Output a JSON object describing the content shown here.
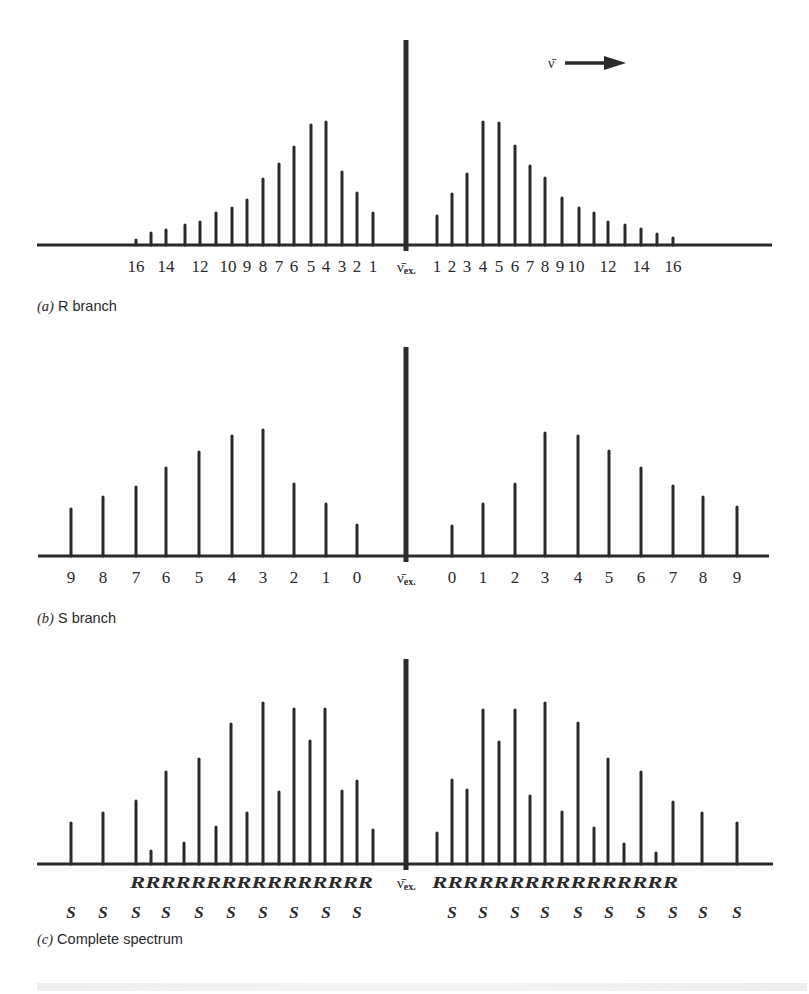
{
  "figure": {
    "direction_label": "ν̄",
    "center_label_main": "ν̄",
    "center_label_sub": "ex.",
    "ink_color": "#2a2a2a",
    "background": "#ffffff"
  },
  "panels": [
    {
      "id": "a",
      "caption_letter": "(a)",
      "caption_text": " R branch"
    },
    {
      "id": "b",
      "caption_letter": "(b)",
      "caption_text": " S branch"
    },
    {
      "id": "c",
      "caption_letter": "(c)",
      "caption_text": " Complete spectrum"
    }
  ],
  "chart_data": [
    {
      "type": "bar",
      "title": "(a) R branch",
      "xlabel": "",
      "ylabel": "",
      "center_label": "ν̄ex.",
      "layout": {
        "baseline_y": 245,
        "axis_x": [
          37,
          772
        ],
        "center_x": 406,
        "center_top": 40,
        "tick_label_y": 272
      },
      "left": {
        "labels_shown": [
          "16",
          "14",
          "12",
          "10",
          "9",
          "8",
          "7",
          "6",
          "5",
          "4",
          "3",
          "2",
          "1"
        ],
        "J": [
          16,
          15,
          14,
          13,
          12,
          11,
          10,
          9,
          8,
          7,
          6,
          5,
          4,
          3,
          2,
          1
        ],
        "x": [
          136,
          151,
          166,
          185,
          200,
          216,
          232,
          247,
          263,
          279,
          294,
          311,
          326,
          342,
          357,
          373
        ],
        "height": [
          5,
          12,
          15,
          20,
          23,
          32,
          37,
          45,
          66,
          81,
          98,
          120,
          123,
          73,
          52,
          32
        ]
      },
      "right": {
        "labels_shown": [
          "1",
          "2",
          "3",
          "4",
          "5",
          "6",
          "7",
          "8",
          "9",
          "10",
          "12",
          "14",
          "16"
        ],
        "J": [
          1,
          2,
          3,
          4,
          5,
          6,
          7,
          8,
          9,
          10,
          11,
          12,
          13,
          14,
          15,
          16
        ],
        "x": [
          437,
          452,
          467,
          483,
          499,
          515,
          530,
          545,
          562,
          579,
          594,
          608,
          625,
          641,
          657,
          673
        ],
        "height": [
          29,
          51,
          71,
          123,
          122,
          99,
          79,
          67,
          47,
          37,
          32,
          23,
          20,
          16,
          11,
          7
        ]
      },
      "tick_labels_left": [
        {
          "t": "16",
          "x": 136
        },
        {
          "t": "14",
          "x": 166
        },
        {
          "t": "12",
          "x": 200
        },
        {
          "t": "10",
          "x": 228
        },
        {
          "t": "9",
          "x": 247
        },
        {
          "t": "8",
          "x": 263
        },
        {
          "t": "7",
          "x": 279
        },
        {
          "t": "6",
          "x": 294
        },
        {
          "t": "5",
          "x": 311
        },
        {
          "t": "4",
          "x": 326
        },
        {
          "t": "3",
          "x": 342
        },
        {
          "t": "2",
          "x": 357
        },
        {
          "t": "1",
          "x": 373
        }
      ],
      "tick_labels_right": [
        {
          "t": "1",
          "x": 437
        },
        {
          "t": "2",
          "x": 452
        },
        {
          "t": "3",
          "x": 467
        },
        {
          "t": "4",
          "x": 483
        },
        {
          "t": "5",
          "x": 499
        },
        {
          "t": "6",
          "x": 515
        },
        {
          "t": "7",
          "x": 530
        },
        {
          "t": "8",
          "x": 545
        },
        {
          "t": "9",
          "x": 560
        },
        {
          "t": "10",
          "x": 576
        },
        {
          "t": "12",
          "x": 608
        },
        {
          "t": "14",
          "x": 641
        },
        {
          "t": "16",
          "x": 673
        }
      ]
    },
    {
      "type": "bar",
      "title": "(b) S branch",
      "xlabel": "",
      "ylabel": "",
      "center_label": "ν̄ex.",
      "layout": {
        "baseline_y": 556,
        "axis_x": [
          38,
          769
        ],
        "center_x": 406,
        "center_top": 347,
        "tick_label_y": 583
      },
      "left": {
        "J": [
          9,
          8,
          7,
          6,
          5,
          4,
          3,
          2,
          1,
          0
        ],
        "x": [
          71,
          103,
          136,
          166,
          199,
          232,
          263,
          294,
          326,
          357
        ],
        "height": [
          47,
          59,
          69,
          88,
          104,
          120,
          126,
          72,
          52,
          31
        ]
      },
      "right": {
        "J": [
          0,
          1,
          2,
          3,
          4,
          5,
          6,
          7,
          8,
          9
        ],
        "x": [
          452,
          483,
          515,
          545,
          578,
          609,
          641,
          673,
          703,
          737
        ],
        "height": [
          30,
          52,
          72,
          123,
          120,
          105,
          88,
          70,
          59,
          49
        ]
      },
      "tick_labels_left": [
        {
          "t": "9",
          "x": 71
        },
        {
          "t": "8",
          "x": 103
        },
        {
          "t": "7",
          "x": 136
        },
        {
          "t": "6",
          "x": 166
        },
        {
          "t": "5",
          "x": 199
        },
        {
          "t": "4",
          "x": 232
        },
        {
          "t": "3",
          "x": 263
        },
        {
          "t": "2",
          "x": 294
        },
        {
          "t": "1",
          "x": 326
        },
        {
          "t": "0",
          "x": 357
        }
      ],
      "tick_labels_right": [
        {
          "t": "0",
          "x": 452
        },
        {
          "t": "1",
          "x": 483
        },
        {
          "t": "2",
          "x": 515
        },
        {
          "t": "3",
          "x": 545
        },
        {
          "t": "4",
          "x": 578
        },
        {
          "t": "5",
          "x": 609
        },
        {
          "t": "6",
          "x": 641
        },
        {
          "t": "7",
          "x": 673
        },
        {
          "t": "8",
          "x": 703
        },
        {
          "t": "9",
          "x": 737
        }
      ]
    },
    {
      "type": "bar",
      "title": "(c) Complete spectrum",
      "xlabel": "",
      "ylabel": "",
      "center_label": "ν̄ex.",
      "layout": {
        "baseline_y": 864,
        "axis_x": [
          37,
          773
        ],
        "center_x": 406,
        "center_top": 659,
        "r_row_y": 888,
        "s_row_y": 918
      },
      "left": {
        "x": [
          71,
          103,
          136,
          151,
          166,
          184,
          199,
          216,
          231,
          247,
          263,
          279,
          294,
          310,
          325,
          342,
          357,
          373
        ],
        "height": [
          41,
          51,
          63,
          13,
          92,
          21,
          105,
          37,
          140,
          51,
          161,
          72,
          155,
          123,
          155,
          73,
          83,
          34
        ],
        "branch": [
          "S",
          "S",
          "S",
          "R",
          "S",
          "R",
          "S",
          "R",
          "S",
          "R",
          "S",
          "R",
          "S",
          "R",
          "S",
          "R",
          "S",
          "R"
        ]
      },
      "right": {
        "x": [
          437,
          452,
          467,
          483,
          499,
          515,
          530,
          545,
          562,
          578,
          594,
          608,
          624,
          641,
          656,
          673,
          702,
          737
        ],
        "height": [
          31,
          84,
          74,
          154,
          122,
          154,
          68,
          161,
          52,
          141,
          36,
          105,
          20,
          92,
          11,
          62,
          51,
          41
        ],
        "branch": [
          "R",
          "S",
          "R",
          "R",
          "R",
          "S",
          "R",
          "S",
          "R",
          "S",
          "R",
          "S",
          "R",
          "S",
          "R",
          "S",
          "S",
          "S"
        ]
      },
      "r_row_left": "RRRRRRRRRRRRRRRR",
      "r_row_right": "RRRRRRRRRRRRRRRR",
      "s_row_left_x": [
        71,
        103,
        136,
        166,
        199,
        231,
        263,
        294,
        326,
        357
      ],
      "s_row_right_x": [
        452,
        483,
        515,
        545,
        578,
        609,
        641,
        673,
        703,
        737
      ],
      "s_label": "S"
    }
  ]
}
